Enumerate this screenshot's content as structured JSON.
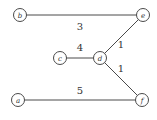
{
  "diagram": {
    "type": "weighted-graph",
    "nodes": [
      {
        "id": "b",
        "label": "b",
        "x": 20,
        "y": 15
      },
      {
        "id": "e",
        "label": "e",
        "x": 143,
        "y": 15
      },
      {
        "id": "c",
        "label": "c",
        "x": 60,
        "y": 58
      },
      {
        "id": "d",
        "label": "d",
        "x": 100,
        "y": 58
      },
      {
        "id": "a",
        "label": "a",
        "x": 18,
        "y": 100
      },
      {
        "id": "f",
        "label": "f",
        "x": 142,
        "y": 100
      }
    ],
    "edges": [
      {
        "from": "b",
        "to": "e",
        "weight": "3",
        "label_x": 80,
        "label_y": 30
      },
      {
        "from": "c",
        "to": "d",
        "weight": "4",
        "label_x": 80,
        "label_y": 51
      },
      {
        "from": "d",
        "to": "e",
        "weight": "1",
        "label_x": 121,
        "label_y": 48
      },
      {
        "from": "d",
        "to": "f",
        "weight": "1",
        "label_x": 121,
        "label_y": 72
      },
      {
        "from": "a",
        "to": "f",
        "weight": "5",
        "label_x": 80,
        "label_y": 94
      }
    ]
  }
}
